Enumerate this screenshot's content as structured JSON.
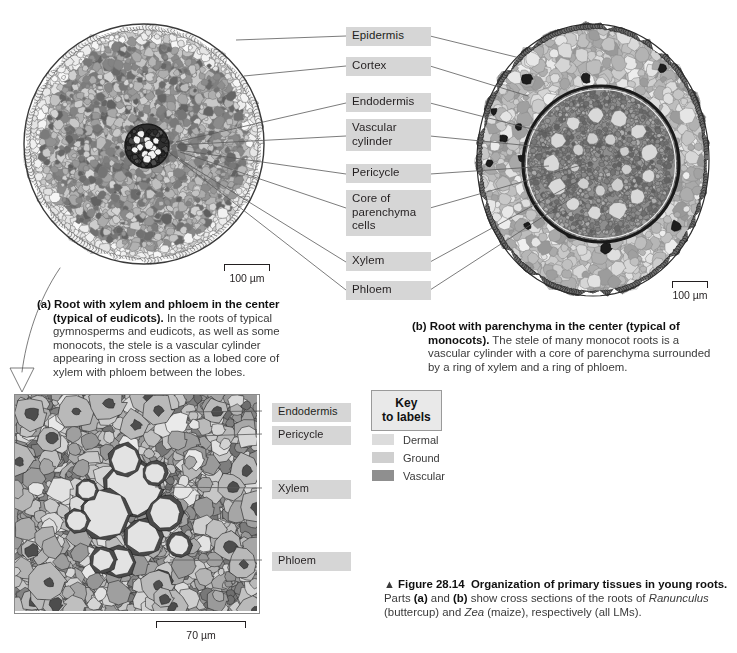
{
  "figure": {
    "number": "Figure 28.14",
    "title": "Organization of primary tissues in young roots.",
    "triangle": "▲",
    "body_1": "Parts ",
    "body_a": "(a)",
    "body_2": " and ",
    "body_b": "(b)",
    "body_3": " show cross sections of the roots of ",
    "species_1": "Ranunculus",
    "body_4": " (buttercup) and ",
    "species_2": "Zea",
    "body_5": " (maize), respectively (all LMs)."
  },
  "panel_a": {
    "letter": "(a)",
    "headline": "Root with xylem and phloem in the center (typical of eudicots).",
    "text": " In the roots of typical gymnosperms and eudicots, as well as some monocots, the stele is a vascular cylinder appearing in cross section as a lobed core of xylem with phloem between the lobes.",
    "scale_label": "100 µm"
  },
  "panel_b": {
    "letter": "(b)",
    "headline": "Root with parenchyma in the center (typical of monocots).",
    "text": " The stele of many monocot roots is a vascular cylinder with a core of parenchyma surrounded by a ring of xylem and a ring of phloem.",
    "scale_label": "100 µm"
  },
  "panel_inset": {
    "scale_label": "70 µm"
  },
  "center_labels": [
    {
      "id": "epidermis",
      "text": "Epidermis"
    },
    {
      "id": "cortex",
      "text": "Cortex"
    },
    {
      "id": "endodermis",
      "text": "Endodermis"
    },
    {
      "id": "vascular-cylinder",
      "text": "Vascular\ncylinder"
    },
    {
      "id": "pericycle",
      "text": "Pericycle"
    },
    {
      "id": "core-parenchyma",
      "text": "Core of\nparenchyma\ncells"
    },
    {
      "id": "xylem",
      "text": "Xylem"
    },
    {
      "id": "phloem",
      "text": "Phloem"
    }
  ],
  "inset_labels": [
    {
      "id": "endodermis",
      "text": "Endodermis"
    },
    {
      "id": "pericycle",
      "text": "Pericycle"
    },
    {
      "id": "xylem",
      "text": "Xylem"
    },
    {
      "id": "phloem",
      "text": "Phloem"
    }
  ],
  "key": {
    "title_line1": "Key",
    "title_line2": "to labels",
    "items": [
      {
        "label": "Dermal",
        "color": "#dcdcdc"
      },
      {
        "label": "Ground",
        "color": "#cfcfcf"
      },
      {
        "label": "Vascular",
        "color": "#8f8f8f"
      }
    ]
  },
  "colors": {
    "label_chip": "#d6d6d6",
    "leader_line": "#5b5b5b",
    "arrow": "#a8a8a8",
    "text": "#231f20"
  }
}
